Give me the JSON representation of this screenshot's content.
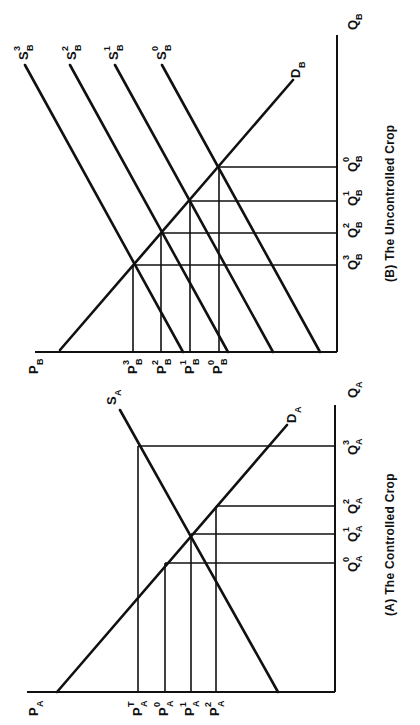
{
  "figure": {
    "orientation": "rotated 90 degrees clockwise",
    "panels": [
      {
        "id": "A",
        "caption": "(A) The Controlled Crop",
        "price_axis_label": "P",
        "price_axis_sub": "A",
        "quantity_axis_label": "Q",
        "quantity_axis_sub": "A",
        "supply_label": "S",
        "supply_sub": "A",
        "demand_label": "D",
        "demand_sub": "A",
        "price_ticks": [
          {
            "base": "P",
            "sub": "A",
            "sup": "T"
          },
          {
            "base": "P",
            "sub": "A",
            "sup": "0"
          },
          {
            "base": "P",
            "sub": "A",
            "sup": "1"
          },
          {
            "base": "P",
            "sub": "A",
            "sup": "2"
          }
        ],
        "quantity_ticks": [
          {
            "base": "Q",
            "sub": "A",
            "sup": "0"
          },
          {
            "base": "Q",
            "sub": "A",
            "sup": "1"
          },
          {
            "base": "Q",
            "sub": "A",
            "sup": "2"
          },
          {
            "base": "Q",
            "sub": "A",
            "sup": "3"
          }
        ]
      },
      {
        "id": "B",
        "caption": "(B) The Uncontrolled Crop",
        "price_axis_label": "P",
        "price_axis_sub": "B",
        "quantity_axis_label": "Q",
        "quantity_axis_sub": "B",
        "demand_label": "D",
        "demand_sub": "B",
        "supply_curves": [
          {
            "base": "S",
            "sub": "B",
            "sup": "0"
          },
          {
            "base": "S",
            "sub": "B",
            "sup": "1"
          },
          {
            "base": "S",
            "sub": "B",
            "sup": "2"
          },
          {
            "base": "S",
            "sub": "B",
            "sup": "3"
          }
        ],
        "price_ticks": [
          {
            "base": "P",
            "sub": "B",
            "sup": "3"
          },
          {
            "base": "P",
            "sub": "B",
            "sup": "2"
          },
          {
            "base": "P",
            "sub": "B",
            "sup": "1"
          },
          {
            "base": "P",
            "sub": "B",
            "sup": "0"
          }
        ],
        "quantity_ticks": [
          {
            "base": "Q",
            "sub": "B",
            "sup": "3"
          },
          {
            "base": "Q",
            "sub": "B",
            "sup": "2"
          },
          {
            "base": "Q",
            "sub": "B",
            "sup": "1"
          },
          {
            "base": "Q",
            "sub": "B",
            "sup": "0"
          }
        ]
      }
    ]
  }
}
